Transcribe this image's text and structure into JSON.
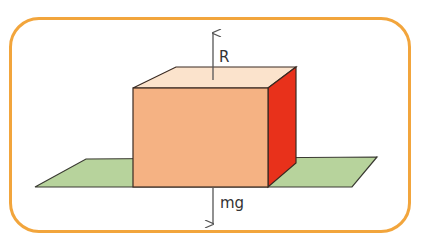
{
  "diagram": {
    "colors": {
      "frame": "#F2A53C",
      "front_face": "#F5B283",
      "top_face": "#FBE3CC",
      "side_face": "#E8311B",
      "ground": "#B7D39C",
      "outline": "#3A2A22",
      "arrow": "#555555"
    },
    "forces": [
      {
        "name": "normal-reaction",
        "label": "R",
        "direction": "up"
      },
      {
        "name": "weight",
        "label": "mg",
        "direction": "down"
      }
    ]
  }
}
